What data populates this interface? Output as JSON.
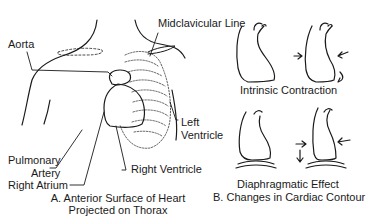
{
  "panel_a": {
    "labels": {
      "aorta": "Aorta",
      "midclavicular_line": "Midclavicular Line",
      "left_ventricle_1": "Left",
      "left_ventricle_2": "Ventricle",
      "pulmonary_artery_1": "Pulmonary",
      "pulmonary_artery_2": "Artery",
      "right_atrium": "Right Atrium",
      "right_ventricle": "Right Ventricle"
    },
    "caption_line1": "A. Anterior Surface of Heart",
    "caption_line2": "Projected on Thorax"
  },
  "panel_b": {
    "intrinsic_contraction": "Intrinsic Contraction",
    "diaphragmatic_effect": "Diaphragmatic Effect",
    "caption": "B. Changes in Cardiac Contour"
  },
  "colors": {
    "ink": "#1a1a1a",
    "background": "#ffffff"
  }
}
